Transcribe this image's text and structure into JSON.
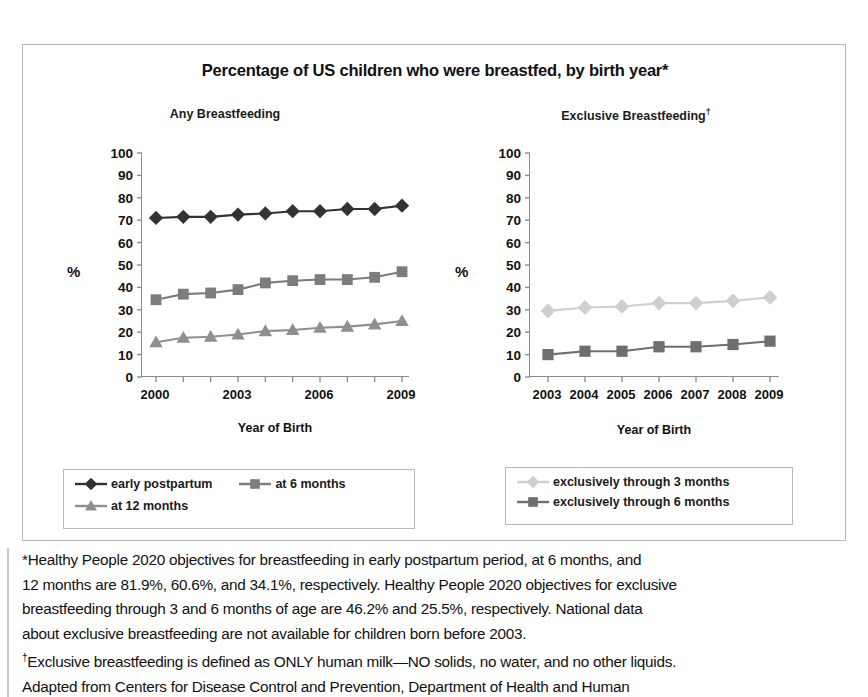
{
  "figure": {
    "title": "Percentage of US children who were breastfed, by birth year*",
    "left_panel_title": "Any Breastfeeding",
    "right_panel_title_main": "Exclusive Breastfeeding",
    "right_panel_title_marker": "†"
  },
  "axes": {
    "y_label": "%",
    "x_label": "Year of Birth",
    "y_ticks": [
      "100",
      "90",
      "80",
      "70",
      "60",
      "50",
      "40",
      "30",
      "20",
      "10",
      "0"
    ],
    "left_x_ticks": [
      "2000",
      "2003",
      "2006",
      "2009"
    ],
    "right_x_ticks": [
      "2003",
      "2004",
      "2005",
      "2006",
      "2007",
      "2008",
      "2009"
    ]
  },
  "legend_left": {
    "items": [
      {
        "label": "early postpartum",
        "marker": "diamond",
        "color": "#333333"
      },
      {
        "label": "at 6 months",
        "marker": "square",
        "color": "#7c7c7c"
      },
      {
        "label": "at 12 months",
        "marker": "triangle",
        "color": "#8f8f8f"
      }
    ]
  },
  "legend_right": {
    "items": [
      {
        "label": "exclusively through 3 months",
        "marker": "diamond",
        "color": "#cfcfcf"
      },
      {
        "label": "exclusively through 6 months",
        "marker": "square",
        "color": "#6e6e6e"
      }
    ]
  },
  "footnote": {
    "line1": "*Healthy People 2020 objectives for breastfeeding in early postpartum period, at 6 months, and",
    "line2": "12 months are 81.9%, 60.6%, and 34.1%, respectively. Healthy People 2020 objectives for exclusive",
    "line3": "breastfeeding through 3 and 6 months of age are 46.2% and 25.5%, respectively. National data",
    "line4": "about exclusive breastfeeding are not available for children born before 2003.",
    "line5_marker": "†",
    "line5": "Exclusive breastfeeding is defined as ONLY human milk—NO solids, no water, and no other liquids.",
    "line6": "Adapted from Centers for Disease Control and Prevention, Department of Health and Human"
  },
  "chart_data": [
    {
      "id": "any-breastfeeding",
      "type": "line",
      "title": "Any Breastfeeding",
      "xlabel": "Year of Birth",
      "ylabel": "%",
      "ylim": [
        0,
        100
      ],
      "ytick_step": 10,
      "grid": false,
      "legend_position": "below",
      "x": [
        2000,
        2001,
        2002,
        2003,
        2004,
        2005,
        2006,
        2007,
        2008,
        2009
      ],
      "xtick_labels": [
        "2000",
        "2003",
        "2006",
        "2009"
      ],
      "series": [
        {
          "name": "early postpartum",
          "marker": "diamond",
          "color": "#333333",
          "values": [
            71.0,
            71.5,
            71.5,
            72.5,
            73.0,
            74.0,
            74.0,
            75.0,
            75.0,
            76.5
          ]
        },
        {
          "name": "at 6 months",
          "marker": "square",
          "color": "#7c7c7c",
          "values": [
            34.5,
            37.0,
            37.5,
            39.0,
            42.0,
            43.0,
            43.5,
            43.5,
            44.5,
            47.0
          ]
        },
        {
          "name": "at 12 months",
          "marker": "triangle",
          "color": "#8f8f8f",
          "values": [
            15.5,
            17.5,
            18.0,
            19.0,
            20.5,
            21.0,
            22.0,
            22.5,
            23.5,
            25.0
          ]
        }
      ]
    },
    {
      "id": "exclusive-breastfeeding",
      "type": "line",
      "title": "Exclusive Breastfeeding",
      "xlabel": "Year of Birth",
      "ylabel": "%",
      "ylim": [
        0,
        100
      ],
      "ytick_step": 10,
      "grid": false,
      "legend_position": "below",
      "x": [
        2003,
        2004,
        2005,
        2006,
        2007,
        2008,
        2009
      ],
      "xtick_labels": [
        "2003",
        "2004",
        "2005",
        "2006",
        "2007",
        "2008",
        "2009"
      ],
      "series": [
        {
          "name": "exclusively through 3 months",
          "marker": "diamond",
          "color": "#cfcfcf",
          "values": [
            29.5,
            31.0,
            31.5,
            33.0,
            33.0,
            34.0,
            35.5
          ]
        },
        {
          "name": "exclusively through 6 months",
          "marker": "square",
          "color": "#6e6e6e",
          "values": [
            10.0,
            11.5,
            11.5,
            13.5,
            13.5,
            14.5,
            16.0
          ]
        }
      ]
    }
  ]
}
